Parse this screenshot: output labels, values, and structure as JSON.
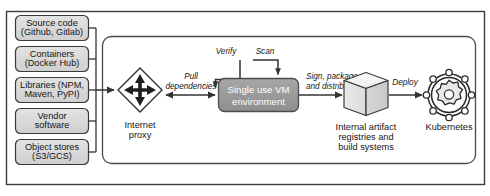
{
  "diagram": {
    "colors": {
      "outer_frame_border": "#3c3c3c",
      "inner_frame_border": "#4a4a4a",
      "source_box_fill": "#d9d9d9",
      "source_box_border": "#3a3a3a",
      "vm_box_fill": "#9b9b9b",
      "vm_box_border": "#4d4d4d",
      "vm_text": "#ffffff",
      "cube_light": "#f2f2f2",
      "cube_mid": "#e2e2e2",
      "cube_dark": "#cfcfcf",
      "line": "#333333",
      "text": "#161616"
    },
    "sources": [
      {
        "id": "source-code",
        "line1": "Source code",
        "line2": "(Github, Gitlab)"
      },
      {
        "id": "containers",
        "line1": "Containers",
        "line2": "(Docker Hub)"
      },
      {
        "id": "libraries",
        "line1": "Libraries (NPM,",
        "line2": "Maven, PyPI)"
      },
      {
        "id": "vendor-software",
        "line1": "Vendor",
        "line2": "software"
      },
      {
        "id": "object-stores",
        "line1": "Object stores",
        "line2": "(S3/GCS)"
      }
    ],
    "nodes": {
      "internet_proxy": {
        "line1": "Internet",
        "line2": "proxy",
        "icon": "four-way-arrows-diamond-icon"
      },
      "vm": {
        "line1": "Single use VM",
        "line2": "environment"
      },
      "artifact_registry": {
        "line1": "Internal artifact",
        "line2": "registries and",
        "line3": "build systems",
        "icon": "cube-icon"
      },
      "kubernetes": {
        "label": "Kubernetes",
        "icon": "kubernetes-helm-icon"
      }
    },
    "edges": {
      "pull_dependencies": {
        "line1": "Pull",
        "line2": "dependencies"
      },
      "verify": {
        "label": "Verify"
      },
      "scan": {
        "label": "Scan"
      },
      "sign_package": {
        "line1": "Sign, package,",
        "line2": "and distribute"
      },
      "deploy": {
        "label": "Deploy"
      }
    }
  }
}
